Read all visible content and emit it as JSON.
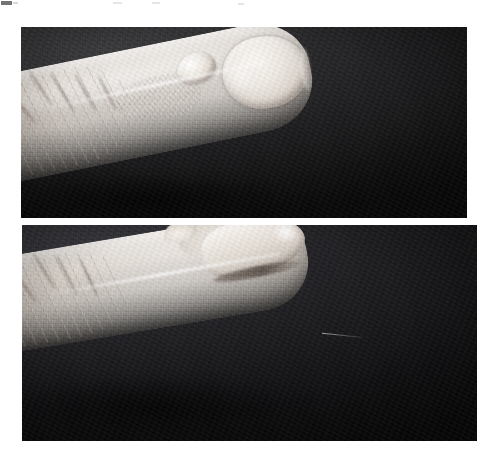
{
  "page": {
    "background_color": "#ffffff",
    "width": 488,
    "height": 454,
    "kind": "scanned-page-with-two-clinical-photographs",
    "visible_text": ""
  },
  "figure": {
    "caption": "",
    "panel_count": 2,
    "panels": [
      {
        "id": "panel-top",
        "label": "",
        "view": "dorsal-oblique",
        "subject": "index fingertip",
        "description": "Oblique dorsal view of a fingertip against a dark backdrop. A pale, dome-shaped nodule sits at the proximal nail fold, adjacent to a mottled, scaly patch of skin. The nail plate appears as a bright oval at the distal end.",
        "frame": {
          "x": 21,
          "y": 27,
          "width": 446,
          "height": 191
        },
        "background_color": "#1d1d1f",
        "skin_tone": "#e6e0da",
        "findings": [
          "periungual nodule at proximal nail fold",
          "mottled scaly skin proximal to lesion",
          "prominent interphalangeal skin creases"
        ]
      },
      {
        "id": "panel-bottom",
        "label": "",
        "view": "lateral-profile",
        "subject": "index fingertip",
        "description": "Lateral profile view of the same fingertip against a dark backdrop, showing the dorsal contour of the distal phalanx, the nail seen edge-on and a small raised nodule on the dorsum near the nail fold.",
        "frame": {
          "x": 22,
          "y": 225,
          "width": 455,
          "height": 216
        },
        "background_color": "#1a1a1d",
        "skin_tone": "#ebe6e1",
        "findings": [
          "raised dorsal nodule in profile",
          "nail seen edge-on",
          "wrinkled skin over proximal interphalangeal joint"
        ]
      }
    ],
    "gap": {
      "y": 218,
      "height": 7,
      "color": "#ffffff"
    }
  },
  "artifacts": {
    "description": "faint scanner smudges along the top edge of the page",
    "marks": [
      {
        "x": 1,
        "y": 1,
        "width": 11,
        "height": 4,
        "tone": "dark"
      },
      {
        "x": 13,
        "y": 2,
        "width": 5,
        "height": 2,
        "tone": "mid"
      },
      {
        "x": 113,
        "y": 2,
        "width": 9,
        "height": 2,
        "tone": "faint"
      },
      {
        "x": 152,
        "y": 2,
        "width": 8,
        "height": 2,
        "tone": "faint"
      },
      {
        "x": 238,
        "y": 3,
        "width": 6,
        "height": 2,
        "tone": "faint"
      }
    ]
  }
}
